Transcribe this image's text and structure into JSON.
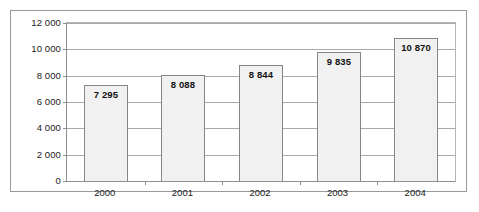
{
  "chart_data": {
    "type": "bar",
    "title": "",
    "subtitle": "",
    "xlabel": "",
    "ylabel": "",
    "categories": [
      "2000",
      "2001",
      "2002",
      "2003",
      "2004"
    ],
    "values": [
      7295,
      8088,
      8844,
      9835,
      10870
    ],
    "value_labels": [
      "7 295",
      "8 088",
      "8 844",
      "9 835",
      "10 870"
    ],
    "series": [
      {
        "name": "",
        "values": [
          7295,
          8088,
          8844,
          9835,
          10870
        ]
      }
    ],
    "ylim": [
      0,
      12000
    ],
    "y_ticks": [
      0,
      2000,
      4000,
      6000,
      8000,
      10000,
      12000
    ],
    "y_tick_labels": [
      "0",
      "2 000",
      "4 000",
      "6 000",
      "8 000",
      "10 000",
      "12 000"
    ],
    "grid": true,
    "grid_axis": "y",
    "legend": false,
    "legend_position": "none",
    "data_labels_shown": true,
    "colors": {
      "bar_fill": "#f1f1f1",
      "bar_border": "#868686",
      "gridline": "#a8a8a8",
      "axis": "#8f8f8f",
      "frame": "#9a9a9a",
      "text": "#1a1a1a",
      "background": "#ffffff"
    }
  }
}
